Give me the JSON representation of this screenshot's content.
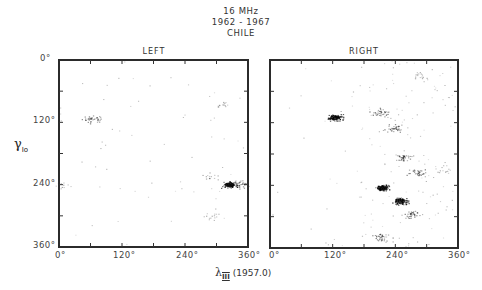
{
  "figure": {
    "title_lines": [
      "16 MHz",
      "1962 - 1967",
      "CHILE"
    ],
    "panels": [
      {
        "label": "LEFT"
      },
      {
        "label": "RIGHT"
      }
    ],
    "ylabel_main": "γ",
    "ylabel_sub": "Io",
    "xlabel_main": "λ",
    "xlabel_sub": "III",
    "xlabel_epoch": "(1957.0)",
    "x_ticks": [
      "0°",
      "120°",
      "240°",
      "360°"
    ],
    "y_ticks": [
      "0°",
      "120°",
      "240°",
      "360°"
    ]
  },
  "chart_data": {
    "type": "scatter",
    "xlabel": "λIII (1957.0)",
    "ylabel": "γIo",
    "xlim": [
      0,
      360
    ],
    "ylim": [
      0,
      360
    ],
    "y_inverted": true,
    "x_ticks": [
      0,
      120,
      240,
      360
    ],
    "y_ticks": [
      0,
      120,
      240,
      360
    ],
    "grid": false,
    "panels": [
      {
        "name": "LEFT",
        "description": "Sparse occurrence probability of Jovian decametric emission vs CML and Io phase; weak activity overall",
        "dense_clusters": [
          {
            "x": 325,
            "y": 240,
            "intensity": "high"
          },
          {
            "x": 60,
            "y": 113,
            "intensity": "medium"
          },
          {
            "x": 345,
            "y": 240,
            "intensity": "medium"
          },
          {
            "x": 285,
            "y": 225,
            "intensity": "low"
          },
          {
            "x": 310,
            "y": 85,
            "intensity": "low"
          },
          {
            "x": 290,
            "y": 300,
            "intensity": "low"
          },
          {
            "x": 5,
            "y": 240,
            "intensity": "low"
          }
        ]
      },
      {
        "name": "RIGHT",
        "description": "Strong Io-related emission; main cluster near λIII 120°, γIo 110°, broad activity 180°–360° in λIII",
        "dense_clusters": [
          {
            "x": 125,
            "y": 110,
            "intensity": "high"
          },
          {
            "x": 210,
            "y": 100,
            "intensity": "medium"
          },
          {
            "x": 235,
            "y": 130,
            "intensity": "medium"
          },
          {
            "x": 255,
            "y": 185,
            "intensity": "medium"
          },
          {
            "x": 280,
            "y": 215,
            "intensity": "medium"
          },
          {
            "x": 215,
            "y": 245,
            "intensity": "high"
          },
          {
            "x": 250,
            "y": 270,
            "intensity": "high"
          },
          {
            "x": 270,
            "y": 295,
            "intensity": "medium"
          },
          {
            "x": 215,
            "y": 340,
            "intensity": "medium"
          },
          {
            "x": 330,
            "y": 210,
            "intensity": "low"
          },
          {
            "x": 290,
            "y": 30,
            "intensity": "low"
          }
        ]
      }
    ]
  }
}
